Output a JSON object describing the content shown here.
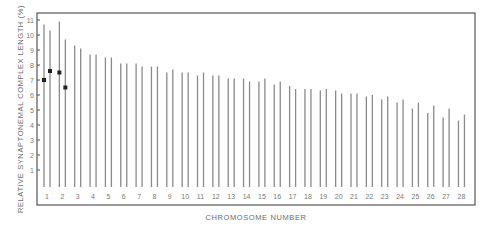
{
  "chart_data": {
    "type": "bar",
    "title": "",
    "xlabel": "CHROMOSOME NUMBER",
    "ylabel": "RELATIVE SYNAPTONEMAL COMPLEX LENGTH (%)",
    "ylim": [
      0,
      11.5
    ],
    "yticks": [
      1,
      2,
      3,
      4,
      5,
      6,
      7,
      8,
      9,
      10,
      11
    ],
    "grid": false,
    "legend": null,
    "categories": [
      "1",
      "2",
      "3",
      "4",
      "5",
      "6",
      "7",
      "8",
      "9",
      "10",
      "11",
      "12",
      "13",
      "14",
      "15",
      "16",
      "17",
      "18",
      "19",
      "20",
      "21",
      "22",
      "23",
      "24",
      "25",
      "26",
      "27",
      "28"
    ],
    "series": [
      {
        "name": "homolog A",
        "values": [
          10.7,
          10.9,
          9.3,
          8.7,
          8.5,
          8.1,
          8.1,
          7.9,
          7.5,
          7.5,
          7.3,
          7.3,
          7.1,
          7.1,
          6.9,
          6.7,
          6.6,
          6.4,
          6.3,
          6.3,
          6.1,
          5.9,
          5.7,
          5.5,
          5.1,
          4.8,
          4.5,
          4.3
        ]
      },
      {
        "name": "homolog B",
        "values": [
          10.3,
          9.7,
          9.1,
          8.7,
          8.5,
          8.1,
          7.9,
          7.9,
          7.7,
          7.5,
          7.5,
          7.3,
          7.1,
          6.9,
          7.1,
          6.9,
          6.4,
          6.4,
          6.4,
          6.1,
          6.1,
          6.0,
          5.9,
          5.7,
          5.5,
          5.3,
          5.1,
          4.7
        ]
      }
    ],
    "points": [
      {
        "chromosome": 1,
        "bar": "A",
        "value": 7.0
      },
      {
        "chromosome": 1,
        "bar": "B",
        "value": 7.6
      },
      {
        "chromosome": 2,
        "bar": "A",
        "value": 7.5
      },
      {
        "chromosome": 2,
        "bar": "B",
        "value": 6.5
      }
    ]
  }
}
